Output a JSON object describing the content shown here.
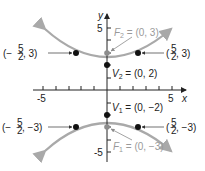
{
  "diagram": {
    "type": "hyperbola-graph",
    "equation_implied": "y^2/4 - x^2/5 = 1",
    "axes": {
      "x_label": "x",
      "y_label": "y",
      "x_ticks": {
        "min_label": "-5",
        "max_label": "5"
      },
      "y_ticks": {
        "max_label": "5",
        "min_label": "-5"
      }
    },
    "colors": {
      "curve": "#a9a9a9",
      "axis": "#222222",
      "point": "#111111",
      "focus_point": "#8c8c8c",
      "focus_label": "#9a9a9a"
    },
    "labels": {
      "F2": {
        "name": "F",
        "sub": "2",
        "value": " = (0, 3)"
      },
      "V2": {
        "name": "V",
        "sub": "2",
        "value": " = (0, 2)"
      },
      "V1": {
        "name": "V",
        "sub": "1",
        "value": " = (0, −2)"
      },
      "F1": {
        "name": "F",
        "sub": "1",
        "value": " = (0, −3)"
      },
      "p_left_top": {
        "open": "(−",
        "num": "5",
        "den": "2",
        "rest": ", 3)"
      },
      "p_right_top": {
        "open": "(",
        "num": "5",
        "den": "2",
        "rest": ", 3)"
      },
      "p_left_bottom": {
        "open": "(−",
        "num": "5",
        "den": "2",
        "rest": ", −3)"
      },
      "p_right_bottom": {
        "open": "(",
        "num": "5",
        "den": "2",
        "rest": ", −3)"
      }
    },
    "points": [
      {
        "label": "V2",
        "x": 0,
        "y": 2
      },
      {
        "label": "F2",
        "x": 0,
        "y": 3
      },
      {
        "label": "V1",
        "x": 0,
        "y": -2
      },
      {
        "label": "F1",
        "x": 0,
        "y": -3
      },
      {
        "label": "(-5/2, 3)",
        "x": -2.5,
        "y": 3
      },
      {
        "label": "(5/2, 3)",
        "x": 2.5,
        "y": 3
      },
      {
        "label": "(-5/2, -3)",
        "x": -2.5,
        "y": -3
      },
      {
        "label": "(5/2, -3)",
        "x": 2.5,
        "y": -3
      }
    ]
  }
}
